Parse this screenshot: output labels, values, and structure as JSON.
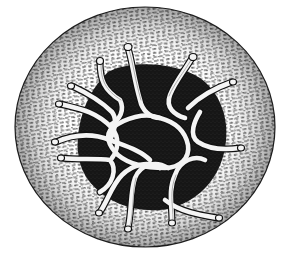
{
  "image": {
    "subject": "engraving of a circular organism with dark central cavity and tangled tentacles",
    "style": "black-and-white etching",
    "colors": {
      "background": "#ffffff",
      "ink": "#111111",
      "cavity": "#161616",
      "tentacle": "#f2f2f2"
    },
    "tentacle_count": 14
  }
}
